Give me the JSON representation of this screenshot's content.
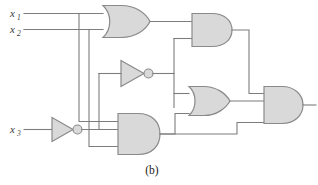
{
  "figure": {
    "caption": "(b)",
    "type": "logic-circuit-diagram",
    "colors": {
      "gate_fill": "#d9d9d9",
      "gate_stroke": "#8a8a8a",
      "wire": "#7d7d7d",
      "label": "#3a3a3a",
      "background": "#ffffff"
    }
  },
  "inputs": [
    {
      "id": "x1",
      "base": "x",
      "subscript": "1"
    },
    {
      "id": "x2",
      "base": "x",
      "subscript": "2"
    },
    {
      "id": "x3",
      "base": "x",
      "subscript": "3"
    }
  ],
  "gates": [
    {
      "id": "or1",
      "type": "OR",
      "inputs": 2,
      "label": "or-gate-top"
    },
    {
      "id": "not1",
      "type": "NOT",
      "inputs": 1,
      "label": "not-gate-middle"
    },
    {
      "id": "not2",
      "type": "NOT",
      "inputs": 1,
      "label": "not-gate-x3"
    },
    {
      "id": "and1",
      "type": "AND",
      "inputs": 2,
      "label": "and-gate-upper-right"
    },
    {
      "id": "and2",
      "type": "AND",
      "inputs": 3,
      "label": "and-gate-bottom"
    },
    {
      "id": "or2",
      "type": "OR",
      "inputs": 2,
      "label": "or-gate-middle-right"
    },
    {
      "id": "and3",
      "type": "AND",
      "inputs": 3,
      "label": "and-gate-output"
    }
  ],
  "output": {
    "id": "f",
    "label": ""
  }
}
